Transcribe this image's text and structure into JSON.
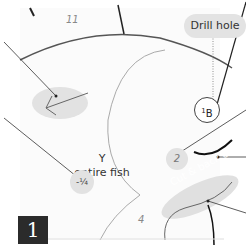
{
  "diagram": {
    "step_number": "1",
    "callouts": {
      "drill_hole": "Drill hole",
      "cut_back_out": "Cut & back out"
    },
    "part_numbers": {
      "top": "11",
      "middle": "2",
      "bottom": "4",
      "circle_superscript": "1",
      "circle_letter": "B"
    },
    "center_label": {
      "line1": "Y",
      "line2": "entire fish"
    },
    "fraction_marker": "-¼"
  }
}
